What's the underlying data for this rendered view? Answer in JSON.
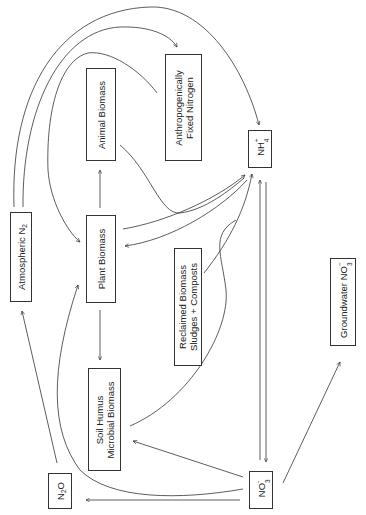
{
  "diagram": {
    "type": "nitrogen-cycle",
    "orientation": "rotated-90-ccw",
    "nodes": {
      "atmospheric_n2": {
        "text": "Atmospheric N",
        "sub": "2"
      },
      "plant_biomass": {
        "text": "Plant Biomass"
      },
      "animal_biomass": {
        "text": "Animal Biomass"
      },
      "anthropogenic": {
        "line1": "Anthropogenically",
        "line2": "Fixed Nitrogen"
      },
      "nh4": {
        "text": "NH",
        "sub": "4",
        "sup": "+"
      },
      "reclaimed": {
        "line1": "Reclaimed Biomass",
        "line2": "Sludges + Composts"
      },
      "soil_humus": {
        "line1": "Soil Humus",
        "line2": "Microbial Biomass"
      },
      "n2o": {
        "text1": "N",
        "sub": "2",
        "text2": "O"
      },
      "no3": {
        "text": "NO",
        "sub": "3",
        "sup": "-"
      },
      "groundwater": {
        "text": "Groundwater NO",
        "sub": "3",
        "sup": "−"
      }
    },
    "edges": [
      {
        "from": "Atmospheric N2",
        "to": "NH4+"
      },
      {
        "from": "Atmospheric N2",
        "to": "Anthropogenically Fixed Nitrogen"
      },
      {
        "from": "Anthropogenically Fixed Nitrogen",
        "to": "Plant Biomass"
      },
      {
        "from": "Plant Biomass",
        "to": "Animal Biomass"
      },
      {
        "from": "Plant Biomass",
        "to": "Soil Humus Microbial Biomass"
      },
      {
        "from": "Animal Biomass",
        "to": "NH4+"
      },
      {
        "from": "Plant Biomass",
        "to": "NH4+"
      },
      {
        "from": "NH4+",
        "to": "Plant Biomass"
      },
      {
        "from": "Reclaimed Biomass Sludges + Composts",
        "to": "NH4+"
      },
      {
        "from": "Soil Humus Microbial Biomass",
        "to": "NH4+"
      },
      {
        "from": "NH4+",
        "to": "NO3-"
      },
      {
        "from": "NO3-",
        "to": "NH4+"
      },
      {
        "from": "NO3-",
        "to": "Plant Biomass"
      },
      {
        "from": "NO3-",
        "to": "Soil Humus Microbial Biomass"
      },
      {
        "from": "NO3-",
        "to": "N2O"
      },
      {
        "from": "NO3-",
        "to": "Groundwater NO3-"
      },
      {
        "from": "N2O",
        "to": "Atmospheric N2"
      }
    ]
  }
}
